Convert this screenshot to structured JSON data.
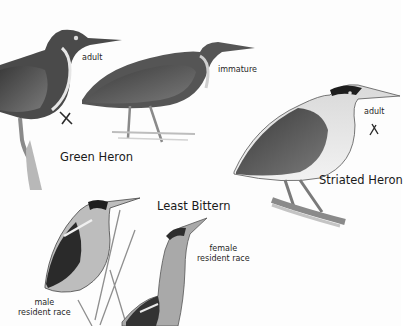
{
  "plate": {
    "species": [
      {
        "name": "Green Heron",
        "figures": [
          {
            "label": "adult",
            "range_mark": true
          },
          {
            "label": "immature",
            "range_mark": false
          }
        ]
      },
      {
        "name": "Striated Heron",
        "figures": [
          {
            "label": "adult",
            "range_mark": true
          }
        ]
      },
      {
        "name": "Least Bittern",
        "figures": [
          {
            "label": "male\nresident race"
          },
          {
            "label": "female\nresident race"
          }
        ]
      }
    ]
  },
  "labels": {
    "green_heron_title": "Green Heron",
    "green_adult": "adult",
    "green_immature": "immature",
    "striated_title": "Striated Heron",
    "striated_adult": "adult",
    "bittern_title": "Least Bittern",
    "bittern_male_line1": "male",
    "bittern_male_line2": "resident race",
    "bittern_female_line1": "female",
    "bittern_female_line2": "resident race"
  },
  "colors": {
    "background": "#fdfdfd",
    "ink_dark": "#1a1a1a",
    "ink_mid": "#5a5a5a",
    "ink_light": "#a8a8a8"
  }
}
